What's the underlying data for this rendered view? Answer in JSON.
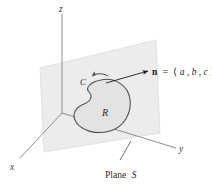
{
  "figure": {
    "background_color": "#ffffff",
    "axes": {
      "z_label": "z",
      "x_label": "x",
      "y_label": "y",
      "axis_color": "#8c8c8c",
      "origin": {
        "x": 62,
        "y": 113
      }
    },
    "plane": {
      "name": "Plane S",
      "label_text": "Plane",
      "label_symbol": "S",
      "fill_color": "#ececed",
      "stroke_color": "#d2d2d2",
      "corners": [
        {
          "x": 40,
          "y": 68
        },
        {
          "x": 156,
          "y": 40
        },
        {
          "x": 160,
          "y": 133
        },
        {
          "x": 44,
          "y": 152
        }
      ]
    },
    "region": {
      "label": "R",
      "fill_color": "#e2e2e2",
      "stroke_color": "#4a4a4a"
    },
    "curve": {
      "label": "C",
      "arrow_direction": "counterclockwise",
      "stroke_color": "#4a4a4a"
    },
    "normal_vector": {
      "symbol": "n",
      "equals": "=",
      "open_bracket": "⟨",
      "components": [
        "a",
        "b",
        "c"
      ],
      "separator": ", ",
      "close_bracket": "⟩",
      "full_label": "n = ⟨a, b, c⟩",
      "leader_color": "#1c1c1c"
    }
  }
}
